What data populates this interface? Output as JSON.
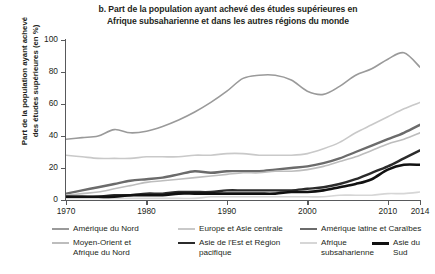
{
  "title": {
    "line1": "b. Part de la population ayant achevé des études supérieures en",
    "line2": "Afrique subsaharienne et dans les autres régions du monde"
  },
  "axes": {
    "y_title_line1": "Part de la population ayant achevé",
    "y_title_line2": "des études supérieures (en %)",
    "y_ticks": [
      "0",
      "20",
      "40",
      "60",
      "80",
      "100"
    ],
    "x_ticks": [
      "1970",
      "1980",
      "1990",
      "2000",
      "2010",
      "2014"
    ]
  },
  "legend": {
    "items": [
      {
        "label": "Amérique du Nord",
        "color": "#9a9a9a",
        "width": 1.6
      },
      {
        "label": "Europe et Asie centrale",
        "color": "#c9c9c9",
        "width": 1.6
      },
      {
        "label": "Amérique latine et Caraïbes",
        "color": "#6b6b6b",
        "width": 2.4
      },
      {
        "label": "Moyen-Orient et\nAfrique du Nord",
        "color": "#bdbdbd",
        "width": 1.6
      },
      {
        "label": "Asie de l'Est et Région\npacifique",
        "color": "#2b2b2b",
        "width": 2.4
      },
      {
        "label": "Afrique\nsubsaharienne",
        "color": "#d6d6d6",
        "width": 1.6
      },
      {
        "label": "Asie du Sud",
        "color": "#111111",
        "width": 2.6
      }
    ]
  },
  "chart_data": {
    "type": "line",
    "title": "b. Part de la population ayant achevé des études supérieures en Afrique subsaharienne et dans les autres régions du monde",
    "xlabel": "",
    "ylabel": "Part de la population ayant achevé des études supérieures (en %)",
    "xlim": [
      1970,
      2014
    ],
    "ylim": [
      0,
      100
    ],
    "grid": false,
    "legend_position": "bottom",
    "x": [
      1970,
      1972,
      1974,
      1976,
      1978,
      1980,
      1982,
      1984,
      1986,
      1988,
      1990,
      1992,
      1994,
      1996,
      1998,
      2000,
      2002,
      2004,
      2006,
      2008,
      2010,
      2012,
      2014
    ],
    "series": [
      {
        "name": "Amérique du Nord",
        "color": "#9a9a9a",
        "values": [
          38,
          39,
          40,
          44,
          42,
          43,
          46,
          50,
          55,
          61,
          68,
          76,
          78,
          78,
          75,
          68,
          66,
          71,
          78,
          82,
          88,
          92,
          83
        ]
      },
      {
        "name": "Europe et Asie centrale",
        "color": "#c9c9c9",
        "values": [
          28,
          27,
          26,
          26,
          26,
          27,
          27,
          27,
          28,
          28,
          29,
          29,
          28,
          28,
          28,
          29,
          32,
          36,
          42,
          47,
          52,
          57,
          61
        ]
      },
      {
        "name": "Amérique latine et Caraïbes",
        "color": "#6b6b6b",
        "values": [
          4,
          6,
          8,
          10,
          12,
          13,
          14,
          16,
          18,
          17,
          18,
          18,
          18,
          19,
          20,
          21,
          23,
          26,
          30,
          34,
          38,
          42,
          47
        ]
      },
      {
        "name": "Moyen-Orient et Afrique du Nord",
        "color": "#bdbdbd",
        "values": [
          3,
          4,
          5,
          7,
          9,
          11,
          12,
          13,
          14,
          15,
          16,
          17,
          17,
          18,
          18,
          19,
          21,
          24,
          27,
          31,
          35,
          38,
          42
        ]
      },
      {
        "name": "Asie de l'Est et Région pacifique",
        "color": "#2b2b2b",
        "values": [
          2,
          2,
          2,
          3,
          3,
          4,
          4,
          5,
          5,
          5,
          6,
          6,
          6,
          6,
          6,
          7,
          8,
          10,
          13,
          17,
          21,
          26,
          31
        ]
      },
      {
        "name": "Afrique subsaharienne",
        "color": "#d6d6d6",
        "values": [
          1,
          1,
          1,
          1,
          1,
          1,
          1,
          1,
          1,
          2,
          2,
          2,
          2,
          2,
          2,
          2,
          2,
          3,
          3,
          3,
          4,
          4,
          5
        ]
      },
      {
        "name": "Asie du Sud",
        "color": "#111111",
        "values": [
          2,
          2,
          2,
          2,
          3,
          3,
          3,
          4,
          4,
          4,
          4,
          4,
          4,
          4,
          5,
          5,
          6,
          8,
          10,
          13,
          19,
          22,
          22
        ]
      }
    ]
  }
}
